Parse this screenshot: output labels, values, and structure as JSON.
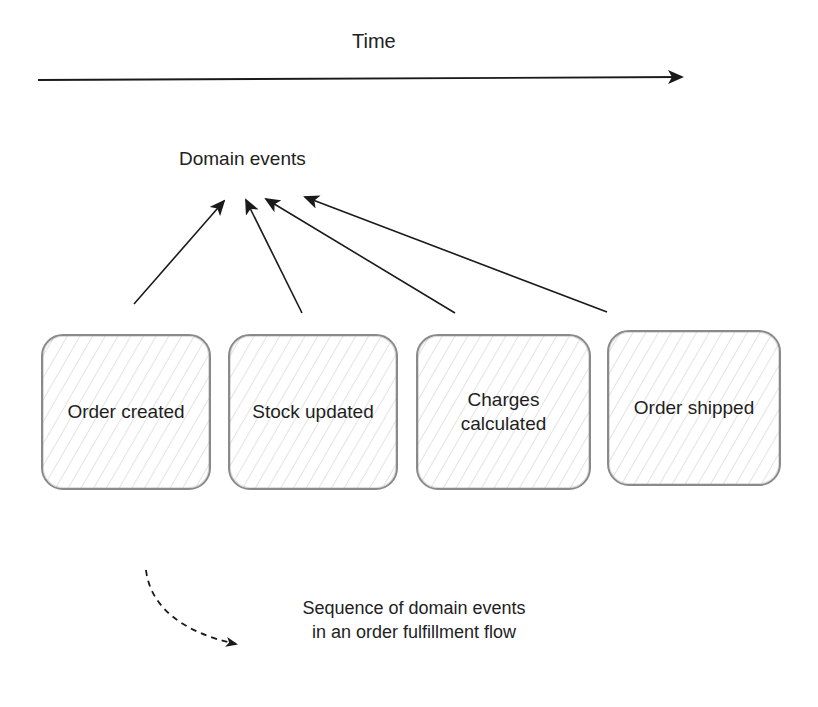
{
  "diagram": {
    "timeline": {
      "label": "Time",
      "direction": "left-to-right"
    },
    "domain_events": {
      "label": "Domain events"
    },
    "events": [
      {
        "label_lines": [
          "Order created"
        ]
      },
      {
        "label_lines": [
          "Stock updated"
        ]
      },
      {
        "label_lines": [
          "Charges",
          "calculated"
        ]
      },
      {
        "label_lines": [
          "Order shipped"
        ]
      }
    ],
    "caption": {
      "lines": [
        "Sequence of domain events",
        "in an order fulfillment flow"
      ]
    },
    "colors": {
      "stroke": "#1a1a1a",
      "box_border": "#8a8a8a",
      "hatch": "#afafaf",
      "background": "#ffffff"
    }
  }
}
